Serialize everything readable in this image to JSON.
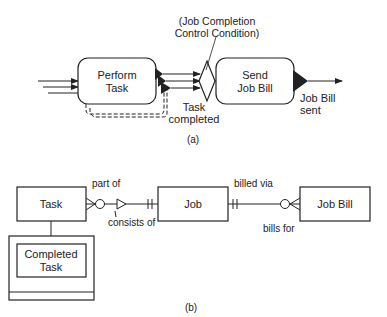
{
  "part_a": {
    "caption": "(a)",
    "perform_task": {
      "line1": "Perform",
      "line2": "Task"
    },
    "send_job_bill": {
      "line1": "Send",
      "line2": "Job Bill"
    },
    "condition_note": {
      "line1": "(Job Completion",
      "line2": "Control Condition)"
    },
    "task_completed": {
      "line1": "Task",
      "line2": "completed"
    },
    "job_bill_sent": {
      "line1": "Job Bill",
      "line2": "sent"
    }
  },
  "part_b": {
    "caption": "(b)",
    "entities": {
      "task": "Task",
      "job": "Job",
      "job_bill": "Job Bill",
      "completed_task": {
        "line1": "Completed",
        "line2": "Task"
      }
    },
    "relationships": {
      "part_of": "part of",
      "consists_of": "consists of",
      "billed_via": "billed via",
      "bills_for": "bills for"
    }
  },
  "colors": {
    "stroke": "#222222",
    "background": "#ffffff"
  }
}
